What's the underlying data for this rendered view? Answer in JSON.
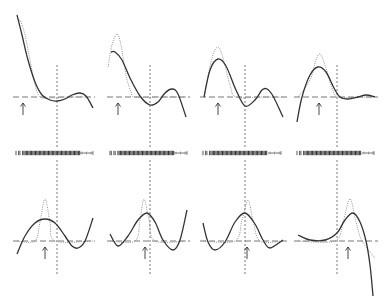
{
  "chart_data": {
    "type": "line",
    "title": "",
    "legend": [],
    "xlabel": "",
    "ylabel": "",
    "grid": false,
    "panels": [
      {
        "row": 1,
        "col": 1,
        "fit": [
          [
            17,
            15
          ],
          [
            22,
            35
          ],
          [
            28,
            60
          ],
          [
            35,
            82
          ],
          [
            42,
            95
          ],
          [
            50,
            100
          ],
          [
            57,
            101
          ],
          [
            65,
            99
          ],
          [
            72,
            95
          ],
          [
            80,
            93
          ],
          [
            86,
            96
          ],
          [
            93,
            108
          ]
        ],
        "truth": [
          [
            19,
            20
          ],
          [
            21,
            22
          ],
          [
            25,
            35
          ],
          [
            30,
            60
          ],
          [
            35,
            85
          ],
          [
            40,
            97
          ],
          [
            50,
            98
          ],
          [
            70,
            97
          ],
          [
            90,
            97
          ]
        ],
        "vline_x": 57,
        "arrow_x": 23,
        "baseline_y": 97
      },
      {
        "row": 1,
        "col": 2,
        "fit": [
          [
            111,
            52
          ],
          [
            115,
            52
          ],
          [
            122,
            60
          ],
          [
            130,
            78
          ],
          [
            140,
            96
          ],
          [
            150,
            105
          ],
          [
            158,
            102
          ],
          [
            165,
            93
          ],
          [
            172,
            89
          ],
          [
            178,
            94
          ],
          [
            186,
            117
          ]
        ],
        "truth": [
          [
            108,
            67
          ],
          [
            112,
            45
          ],
          [
            117,
            34
          ],
          [
            121,
            45
          ],
          [
            126,
            75
          ],
          [
            131,
            92
          ],
          [
            135,
            97
          ],
          [
            160,
            97
          ],
          [
            186,
            97
          ]
        ],
        "vline_x": 150,
        "arrow_x": 118,
        "baseline_y": 97
      },
      {
        "row": 1,
        "col": 3,
        "fit": [
          [
            204,
            97
          ],
          [
            210,
            70
          ],
          [
            218,
            59
          ],
          [
            226,
            66
          ],
          [
            236,
            90
          ],
          [
            245,
            106
          ],
          [
            255,
            100
          ],
          [
            262,
            90
          ],
          [
            267,
            89
          ],
          [
            273,
            96
          ],
          [
            283,
            117
          ]
        ],
        "truth": [
          [
            204,
            97
          ],
          [
            212,
            58
          ],
          [
            218,
            47
          ],
          [
            223,
            58
          ],
          [
            230,
            85
          ],
          [
            236,
            97
          ],
          [
            260,
            97
          ],
          [
            283,
            97
          ]
        ],
        "vline_x": 245,
        "arrow_x": 218,
        "baseline_y": 97
      },
      {
        "row": 1,
        "col": 4,
        "fit": [
          [
            297,
            122
          ],
          [
            302,
            97
          ],
          [
            310,
            75
          ],
          [
            318,
            67
          ],
          [
            326,
            72
          ],
          [
            334,
            88
          ],
          [
            340,
            97
          ],
          [
            348,
            99
          ],
          [
            358,
            97
          ],
          [
            366,
            95
          ],
          [
            375,
            97
          ]
        ],
        "truth": [
          [
            298,
            97
          ],
          [
            310,
            80
          ],
          [
            316,
            60
          ],
          [
            320,
            54
          ],
          [
            325,
            65
          ],
          [
            332,
            88
          ],
          [
            338,
            97
          ],
          [
            360,
            97
          ],
          [
            375,
            97
          ]
        ],
        "vline_x": 337,
        "arrow_x": 319,
        "baseline_y": 97
      },
      {
        "row": 2,
        "col": 1,
        "fit": [
          [
            17,
            254
          ],
          [
            25,
            236
          ],
          [
            35,
            223
          ],
          [
            45,
            219
          ],
          [
            55,
            223
          ],
          [
            65,
            236
          ],
          [
            72,
            246
          ],
          [
            78,
            248
          ],
          [
            85,
            241
          ],
          [
            93,
            218
          ]
        ],
        "truth": [
          [
            17,
            241
          ],
          [
            35,
            241
          ],
          [
            40,
            222
          ],
          [
            45,
            199
          ],
          [
            50,
            222
          ],
          [
            55,
            241
          ],
          [
            93,
            241
          ]
        ],
        "vline_x": 57,
        "arrow_x": 45,
        "baseline_y": 241
      },
      {
        "row": 2,
        "col": 2,
        "fit": [
          [
            110,
            234
          ],
          [
            118,
            246
          ],
          [
            128,
            236
          ],
          [
            138,
            220
          ],
          [
            147,
            213
          ],
          [
            155,
            222
          ],
          [
            163,
            240
          ],
          [
            173,
            250
          ],
          [
            180,
            240
          ],
          [
            187,
            210
          ]
        ],
        "truth": [
          [
            110,
            241
          ],
          [
            135,
            241
          ],
          [
            140,
            220
          ],
          [
            144,
            199
          ],
          [
            149,
            220
          ],
          [
            155,
            241
          ],
          [
            187,
            241
          ]
        ],
        "vline_x": 150,
        "arrow_x": 145,
        "baseline_y": 241
      },
      {
        "row": 2,
        "col": 3,
        "fit": [
          [
            203,
            223
          ],
          [
            208,
            242
          ],
          [
            215,
            250
          ],
          [
            225,
            242
          ],
          [
            235,
            222
          ],
          [
            245,
            213
          ],
          [
            255,
            224
          ],
          [
            263,
            240
          ],
          [
            270,
            248
          ],
          [
            283,
            240
          ]
        ],
        "truth": [
          [
            203,
            241
          ],
          [
            235,
            241
          ],
          [
            242,
            220
          ],
          [
            248,
            200
          ],
          [
            253,
            220
          ],
          [
            260,
            241
          ],
          [
            283,
            241
          ]
        ],
        "vline_x": 245,
        "arrow_x": 247,
        "baseline_y": 241
      },
      {
        "row": 2,
        "col": 4,
        "fit": [
          [
            298,
            235
          ],
          [
            310,
            240
          ],
          [
            325,
            240
          ],
          [
            337,
            233
          ],
          [
            345,
            220
          ],
          [
            353,
            213
          ],
          [
            360,
            222
          ],
          [
            366,
            241
          ],
          [
            370,
            265
          ],
          [
            373,
            296
          ]
        ],
        "truth": [
          [
            298,
            241
          ],
          [
            335,
            241
          ],
          [
            343,
            222
          ],
          [
            350,
            199
          ],
          [
            356,
            222
          ],
          [
            362,
            241
          ],
          [
            375,
            258
          ]
        ],
        "vline_x": 337,
        "arrow_x": 348,
        "baseline_y": 241
      }
    ],
    "rug": [
      {
        "x0": 16,
        "x1": 80,
        "tail_end": 93,
        "y": 153
      },
      {
        "x0": 110,
        "x1": 174,
        "tail_end": 187,
        "y": 153
      },
      {
        "x0": 203,
        "x1": 268,
        "tail_end": 281,
        "y": 153
      },
      {
        "x0": 297,
        "x1": 362,
        "tail_end": 374,
        "y": 153
      }
    ]
  },
  "panel_bounds": [
    {
      "x0": 13,
      "x1": 95,
      "y_top": 10,
      "y_bottom": 148,
      "vline_top": 65
    },
    {
      "x0": 107,
      "x1": 190,
      "y_top": 10,
      "y_bottom": 148,
      "vline_top": 65
    },
    {
      "x0": 200,
      "x1": 287,
      "y_top": 10,
      "y_bottom": 148,
      "vline_top": 65
    },
    {
      "x0": 294,
      "x1": 378,
      "y_top": 10,
      "y_bottom": 148,
      "vline_top": 65
    },
    {
      "x0": 13,
      "x1": 95,
      "y_top": 160,
      "y_bottom": 304,
      "vline_top": 160,
      "vline_bottom": 275
    },
    {
      "x0": 107,
      "x1": 190,
      "y_top": 160,
      "y_bottom": 304,
      "vline_top": 160,
      "vline_bottom": 275
    },
    {
      "x0": 200,
      "x1": 287,
      "y_top": 160,
      "y_bottom": 304,
      "vline_top": 160,
      "vline_bottom": 275
    },
    {
      "x0": 294,
      "x1": 378,
      "y_top": 160,
      "y_bottom": 304,
      "vline_top": 160,
      "vline_bottom": 275
    }
  ]
}
